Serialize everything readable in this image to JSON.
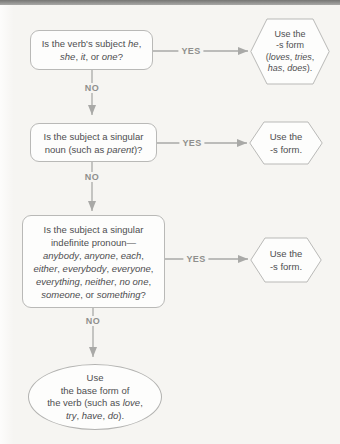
{
  "page": {
    "background": "#f6f5f2",
    "top_bar_gradient": [
      "#767674",
      "#a9a9a7"
    ]
  },
  "colors": {
    "box_border": "#b9b9b7",
    "box_fill": "#fdfdfc",
    "arrow": "#a9a9a7",
    "text": "#4e4e50",
    "branch_label": "#8f8f8d"
  },
  "labels": {
    "yes": "YES",
    "no": "NO"
  },
  "nodes": {
    "q1": {
      "lines": [
        [
          {
            "text": "Is the verb's subject ",
            "italic": false
          },
          {
            "text": "he",
            "italic": true
          },
          {
            "text": ",",
            "italic": false
          }
        ],
        [
          {
            "text": "she",
            "italic": true
          },
          {
            "text": ", ",
            "italic": false
          },
          {
            "text": "it",
            "italic": true
          },
          {
            "text": ", or ",
            "italic": false
          },
          {
            "text": "one",
            "italic": true
          },
          {
            "text": "?",
            "italic": false
          }
        ]
      ]
    },
    "r1": {
      "lines": [
        [
          {
            "text": "Use the",
            "italic": false
          }
        ],
        [
          {
            "text": "-s form",
            "italic": false
          }
        ],
        [
          {
            "text": "(",
            "italic": false
          },
          {
            "text": "loves",
            "italic": true
          },
          {
            "text": ", ",
            "italic": false
          },
          {
            "text": "tries",
            "italic": true
          },
          {
            "text": ",",
            "italic": false
          }
        ],
        [
          {
            "text": "has",
            "italic": true
          },
          {
            "text": ", ",
            "italic": false
          },
          {
            "text": "does",
            "italic": true
          },
          {
            "text": ").",
            "italic": false
          }
        ]
      ]
    },
    "q2": {
      "lines": [
        [
          {
            "text": "Is the subject a singular",
            "italic": false
          }
        ],
        [
          {
            "text": "noun (such as ",
            "italic": false
          },
          {
            "text": "parent",
            "italic": true
          },
          {
            "text": ")?",
            "italic": false
          }
        ]
      ]
    },
    "r2": {
      "lines": [
        [
          {
            "text": "Use the",
            "italic": false
          }
        ],
        [
          {
            "text": "-s form.",
            "italic": false
          }
        ]
      ]
    },
    "q3": {
      "lines": [
        [
          {
            "text": "Is the subject a singular",
            "italic": false
          }
        ],
        [
          {
            "text": "indefinite pronoun—",
            "italic": false
          }
        ],
        [
          {
            "text": "anybody",
            "italic": true
          },
          {
            "text": ", ",
            "italic": false
          },
          {
            "text": "anyone",
            "italic": true
          },
          {
            "text": ", ",
            "italic": false
          },
          {
            "text": "each",
            "italic": true
          },
          {
            "text": ",",
            "italic": false
          }
        ],
        [
          {
            "text": "either",
            "italic": true
          },
          {
            "text": ", ",
            "italic": false
          },
          {
            "text": "everybody",
            "italic": true
          },
          {
            "text": ", ",
            "italic": false
          },
          {
            "text": "everyone",
            "italic": true
          },
          {
            "text": ",",
            "italic": false
          }
        ],
        [
          {
            "text": "everything",
            "italic": true
          },
          {
            "text": ", ",
            "italic": false
          },
          {
            "text": "neither",
            "italic": true
          },
          {
            "text": ", ",
            "italic": false
          },
          {
            "text": "no one",
            "italic": true
          },
          {
            "text": ",",
            "italic": false
          }
        ],
        [
          {
            "text": "someone",
            "italic": true
          },
          {
            "text": ", or ",
            "italic": false
          },
          {
            "text": "something",
            "italic": true
          },
          {
            "text": "?",
            "italic": false
          }
        ]
      ]
    },
    "r3": {
      "lines": [
        [
          {
            "text": "Use the",
            "italic": false
          }
        ],
        [
          {
            "text": "-s form.",
            "italic": false
          }
        ]
      ]
    },
    "final": {
      "lines": [
        [
          {
            "text": "Use",
            "italic": false
          }
        ],
        [
          {
            "text": "the base form of",
            "italic": false
          }
        ],
        [
          {
            "text": "the verb (such as ",
            "italic": false
          },
          {
            "text": "love",
            "italic": true
          },
          {
            "text": ",",
            "italic": false
          }
        ],
        [
          {
            "text": "try",
            "italic": true
          },
          {
            "text": ", ",
            "italic": false
          },
          {
            "text": "have",
            "italic": true
          },
          {
            "text": ", ",
            "italic": false
          },
          {
            "text": "do",
            "italic": true
          },
          {
            "text": ").",
            "italic": false
          }
        ]
      ]
    }
  }
}
